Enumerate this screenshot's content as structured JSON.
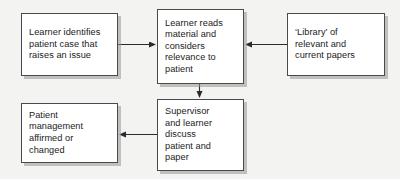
{
  "diagram": {
    "background_color": "#f3f3f1",
    "box_fill_color": "#ffffff",
    "box_border_color": "#4a4a4a",
    "shadow_color": "#969696",
    "text_color": "#1b1b1b",
    "nodes": [
      {
        "id": "learner-identifies",
        "text": "Learner identifies\npatient case that\nraises an issue"
      },
      {
        "id": "learner-reads",
        "text": "Learner reads\nmaterial and\nconsiders\nrelevance to\npatient"
      },
      {
        "id": "library",
        "text": "‘Library’ of\nrelevant and\ncurrent papers"
      },
      {
        "id": "supervisor",
        "text": "Supervisor\nand learner\ndiscuss\npatient and\npaper"
      },
      {
        "id": "patient-management",
        "text": "Patient\nmanagement\naffirmed or\nchanged"
      }
    ],
    "edges": [
      {
        "id": "edge-identifies-to-reads",
        "from": "learner-identifies",
        "to": "learner-reads",
        "direction": "right",
        "label": ""
      },
      {
        "id": "edge-library-to-reads",
        "from": "library",
        "to": "learner-reads",
        "direction": "left",
        "label": ""
      },
      {
        "id": "edge-reads-to-supervisor",
        "from": "learner-reads",
        "to": "supervisor",
        "direction": "down",
        "label": ""
      },
      {
        "id": "edge-supervisor-to-patient",
        "from": "supervisor",
        "to": "patient-management",
        "direction": "left",
        "label": ""
      }
    ]
  }
}
